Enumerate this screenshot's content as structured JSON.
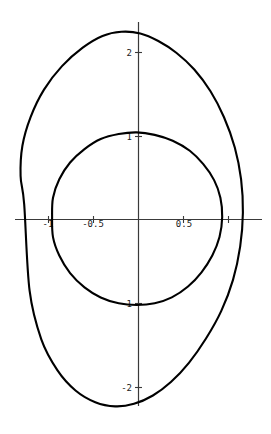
{
  "figure": {
    "title": "",
    "background_color": "#ffffff",
    "curve_color": "#000000",
    "axis_color": "#3a3a3a",
    "label_color": "#1a1a1a",
    "width_px": 271,
    "height_px": 434
  },
  "chart_data": {
    "type": "line",
    "title": "",
    "xlabel": "",
    "ylabel": "",
    "grid": false,
    "legend": false,
    "axes_style": "centered-cross",
    "xlim": [
      -1.35,
      1.4
    ],
    "ylim": [
      -2.55,
      2.5
    ],
    "xticks": [
      -1,
      -0.5,
      0.5
    ],
    "xtick_labels": [
      "-1",
      "-0.5",
      "0.5"
    ],
    "yticks": [
      2,
      1,
      -1,
      -2
    ],
    "ytick_labels": [
      "2",
      "1",
      "-1",
      "-2"
    ],
    "series": [
      {
        "name": "outer-curve",
        "closed": true,
        "description": "large tilted oval",
        "x": [
          -1.27,
          -1.31,
          -1.29,
          -1.2,
          -1.05,
          -0.85,
          -0.62,
          -0.4,
          -0.19,
          0.02,
          0.22,
          0.42,
          0.62,
          0.8,
          0.95,
          1.07,
          1.14,
          1.16,
          1.13,
          1.05,
          0.92,
          0.75,
          0.56,
          0.36,
          0.16,
          -0.05,
          -0.26,
          -0.48,
          -0.7,
          -0.9,
          -1.08,
          -1.21,
          -1.27
        ],
        "y": [
          0.18,
          0.52,
          0.88,
          1.22,
          1.55,
          1.83,
          2.05,
          2.19,
          2.24,
          2.22,
          2.13,
          1.99,
          1.79,
          1.53,
          1.22,
          0.86,
          0.48,
          0.08,
          -0.32,
          -0.72,
          -1.09,
          -1.42,
          -1.71,
          -1.94,
          -2.1,
          -2.2,
          -2.23,
          -2.18,
          -2.04,
          -1.8,
          -1.43,
          -0.85,
          0.18
        ]
      },
      {
        "name": "inner-curve",
        "closed": true,
        "description": "smaller near-circular oval",
        "x": [
          -0.96,
          -0.95,
          -0.88,
          -0.76,
          -0.6,
          -0.42,
          -0.22,
          -0.02,
          0.18,
          0.38,
          0.57,
          0.72,
          0.84,
          0.91,
          0.93,
          0.9,
          0.82,
          0.7,
          0.55,
          0.37,
          0.18,
          -0.02,
          -0.22,
          -0.42,
          -0.6,
          -0.76,
          -0.88,
          -0.95,
          -0.96
        ],
        "y": [
          0.03,
          0.26,
          0.48,
          0.68,
          0.84,
          0.96,
          1.02,
          1.04,
          1.01,
          0.94,
          0.82,
          0.66,
          0.47,
          0.26,
          0.03,
          -0.21,
          -0.43,
          -0.63,
          -0.8,
          -0.93,
          -1.0,
          -1.02,
          -1.0,
          -0.93,
          -0.81,
          -0.64,
          -0.43,
          -0.21,
          0.03
        ]
      }
    ]
  },
  "axes": {
    "x_axis_label": "x-axis",
    "y_axis_label": "y-axis",
    "x_tick_texts": [
      "-1",
      "-0.5",
      "0.5"
    ],
    "y_tick_texts": [
      "2",
      "1",
      "-1",
      "-2"
    ]
  },
  "labels": {
    "x_neg1": "-1",
    "x_neg05": "-0.5",
    "x_pos05": "0.5",
    "y_pos2": "2",
    "y_pos1": "1",
    "y_neg1": "-1",
    "y_neg2": "-2"
  }
}
